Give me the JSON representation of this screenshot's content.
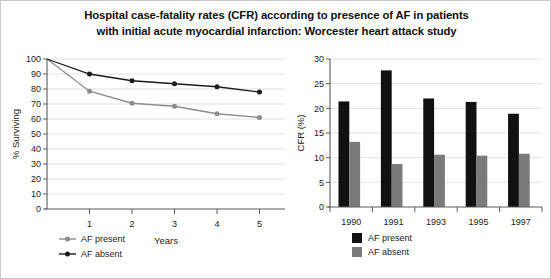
{
  "title": {
    "line1": "Hospital case-fatality rates (CFR) according to presence of AF in patients",
    "line2": "with initial acute myocardial infarction: Worcester heart attack study"
  },
  "colors": {
    "af_present_line": "#8c8c8c",
    "af_absent_line": "#1a1a1a",
    "af_present_bar": "#111111",
    "af_absent_bar": "#7a7a7a",
    "grid": "#e2e2e2",
    "axis": "#5a5a5a",
    "frame": "#c9c9c9"
  },
  "chart_data": [
    {
      "type": "line",
      "id": "survival-curve",
      "title": "",
      "xlabel": "Years",
      "ylabel": "% Surviving",
      "x": [
        0,
        1,
        2,
        3,
        4,
        5
      ],
      "xticks": [
        1,
        2,
        3,
        4,
        5
      ],
      "xtick_labels": [
        "1",
        "2",
        "3",
        "4",
        "5"
      ],
      "xlim": [
        0,
        5.6
      ],
      "ylim": [
        0,
        100
      ],
      "yticks": [
        0,
        10,
        20,
        30,
        40,
        50,
        60,
        70,
        80,
        90,
        100
      ],
      "ytick_labels": [
        "0",
        "10",
        "20",
        "30",
        "40",
        "50",
        "60",
        "70",
        "80",
        "90",
        "100"
      ],
      "grid": true,
      "legend_position": "below-left",
      "series": [
        {
          "name": "AF present",
          "color": "#8c8c8c",
          "values": [
            100,
            78.5,
            70.5,
            68.5,
            63.5,
            61
          ]
        },
        {
          "name": "AF absent",
          "color": "#1a1a1a",
          "values": [
            100,
            90,
            85.5,
            83.5,
            81.5,
            78
          ]
        }
      ]
    },
    {
      "type": "bar",
      "id": "cfr-bars",
      "title": "",
      "xlabel": "",
      "ylabel": "CFR (%)",
      "categories": [
        "1990",
        "1991",
        "1993",
        "1995",
        "1997"
      ],
      "ylim": [
        0,
        30
      ],
      "yticks": [
        0,
        5,
        10,
        15,
        20,
        25,
        30
      ],
      "ytick_labels": [
        "0",
        "5",
        "10",
        "15",
        "20",
        "25",
        "30"
      ],
      "grid": true,
      "legend_position": "below-center",
      "series": [
        {
          "name": "AF present",
          "color": "#111111",
          "values": [
            21.4,
            27.7,
            22.0,
            21.3,
            18.9
          ]
        },
        {
          "name": "AF absent",
          "color": "#7a7a7a",
          "values": [
            13.2,
            8.7,
            10.6,
            10.4,
            10.8
          ]
        }
      ]
    }
  ]
}
